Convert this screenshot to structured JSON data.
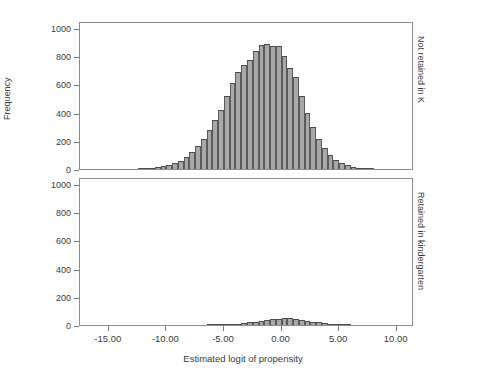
{
  "chart_data": {
    "type": "bar",
    "title": "",
    "subtitle": "",
    "xlabel": "Estimated logit of propensity",
    "ylabel": "Frequency",
    "grid": false,
    "legend_position": "none",
    "xlim": [
      -17.5,
      11.5
    ],
    "ylim": [
      0,
      1050
    ],
    "xticks": [
      -15,
      -10,
      -5,
      0,
      5,
      10
    ],
    "xticklabels": [
      "-15.00",
      "-10.00",
      "-5.00",
      "0.00",
      "5.00",
      "10.00"
    ],
    "yticks": [
      0,
      200,
      400,
      600,
      800,
      1000
    ],
    "yticklabels": [
      "0",
      "200",
      "400",
      "600",
      "800",
      "1000"
    ],
    "bin_width": 0.5,
    "panels": [
      {
        "strip_label": "Not retained in K",
        "bin_centers": [
          -12.25,
          -11.75,
          -11.25,
          -10.75,
          -10.25,
          -9.75,
          -9.25,
          -8.75,
          -8.25,
          -7.75,
          -7.25,
          -6.75,
          -6.25,
          -5.75,
          -5.25,
          -4.75,
          -4.25,
          -3.75,
          -3.25,
          -2.75,
          -2.25,
          -1.75,
          -1.25,
          -0.75,
          -0.25,
          0.25,
          0.75,
          1.25,
          1.75,
          2.25,
          2.75,
          3.25,
          3.75,
          4.25
        ],
        "values": [
          3,
          5,
          8,
          12,
          18,
          28,
          42,
          60,
          85,
          120,
          165,
          215,
          275,
          345,
          420,
          515,
          610,
          685,
          740,
          775,
          835,
          880,
          890,
          875,
          875,
          800,
          715,
          655,
          520,
          400,
          300,
          215,
          150,
          100,
          65,
          40,
          25,
          15,
          8,
          5,
          3
        ]
      },
      {
        "strip_label": "Retained in kindergarten",
        "bin_centers": [
          -6.25,
          -5.75,
          -5.25,
          -4.75,
          -4.25,
          -3.75,
          -3.25,
          -2.75,
          -2.25,
          -1.75,
          -1.25,
          -0.75,
          -0.25,
          0.25,
          0.75,
          1.25,
          1.75,
          2.25,
          2.75,
          3.25,
          3.75
        ],
        "values": [
          2,
          3,
          4,
          5,
          7,
          10,
          14,
          18,
          24,
          30,
          35,
          40,
          45,
          48,
          47,
          44,
          38,
          30,
          24,
          18,
          12,
          8,
          5,
          3,
          2
        ]
      }
    ]
  },
  "panel_top": {
    "strip_label": "Not retained in K"
  },
  "panel_bottom": {
    "strip_label": "Retained in kindergarten"
  },
  "axes": {
    "ylabel": "Frequency",
    "xlabel": "Estimated logit of propensity"
  },
  "colors": {
    "bar_fill": "#a8a8a8",
    "bar_edge": "#4a4a4a",
    "box": "#8d8d8d",
    "text": "#3a3a3a"
  }
}
